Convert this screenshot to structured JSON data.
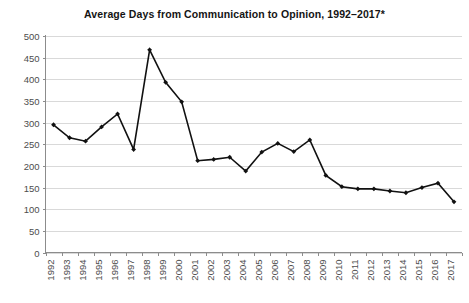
{
  "chart_data": {
    "type": "line",
    "title": "Average Days from Communication to Opinion, 1992–2017*",
    "xlabel": "",
    "ylabel": "",
    "x": [
      1992,
      1993,
      1994,
      1995,
      1996,
      1997,
      1998,
      1999,
      2000,
      2001,
      2002,
      2003,
      2004,
      2005,
      2006,
      2007,
      2008,
      2009,
      2010,
      2011,
      2012,
      2013,
      2014,
      2015,
      2016,
      2017
    ],
    "categories": [
      "1992",
      "1993",
      "1994",
      "1995",
      "1996",
      "1997",
      "1998",
      "1999",
      "2000",
      "2001",
      "2002",
      "2003",
      "2004",
      "2005",
      "2006",
      "2007",
      "2008",
      "2009",
      "2010",
      "2011",
      "2012",
      "2013",
      "2014",
      "2015",
      "2016",
      "2017"
    ],
    "values": [
      295,
      265,
      257,
      290,
      320,
      238,
      468,
      393,
      348,
      212,
      215,
      220,
      188,
      232,
      252,
      233,
      260,
      178,
      152,
      147,
      147,
      142,
      138,
      150,
      160,
      117
    ],
    "series": [
      {
        "name": "Average days from communication to opinion",
        "values": [
          295,
          265,
          257,
          290,
          320,
          238,
          468,
          393,
          348,
          212,
          215,
          220,
          188,
          232,
          252,
          233,
          260,
          178,
          152,
          147,
          147,
          142,
          138,
          150,
          160,
          117
        ]
      }
    ],
    "ylim": [
      0,
      500
    ],
    "yticks": [
      0,
      50,
      100,
      150,
      200,
      250,
      300,
      350,
      400,
      450,
      500
    ],
    "ytick_labels": [
      "0",
      "50",
      "100",
      "150",
      "200",
      "250",
      "300",
      "350",
      "400",
      "450",
      "500"
    ],
    "grid": true,
    "grid_axis": "y",
    "legend": false,
    "legend_position": "none",
    "marker": "diamond",
    "line_color": "#111111",
    "grid_color": "#d9d9d9",
    "axis_color": "#8c8c8c",
    "background_color": "#ffffff",
    "xtick_rotation": 90,
    "annotations": []
  }
}
